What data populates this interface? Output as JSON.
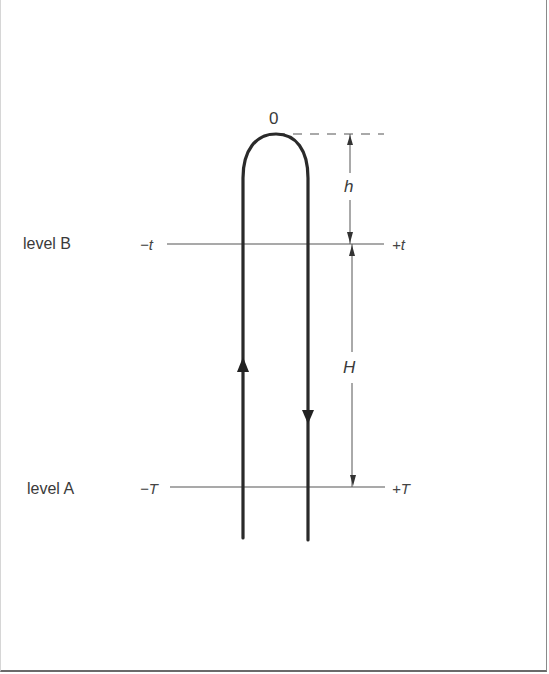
{
  "diagram": {
    "apex_label": "0",
    "levels": [
      {
        "name": "level B",
        "left_label": "−t",
        "right_label": "+t",
        "y": 244
      },
      {
        "name": "level A",
        "left_label": "−T",
        "right_label": "+T",
        "y": 487
      }
    ],
    "dimensions": {
      "upper": "h",
      "lower": "H"
    },
    "path": {
      "up_leg_direction": "up",
      "down_leg_direction": "down"
    },
    "colors": {
      "stroke": "#2a2a2a",
      "thin_stroke": "#555555",
      "text": "#3a3a3a"
    }
  }
}
